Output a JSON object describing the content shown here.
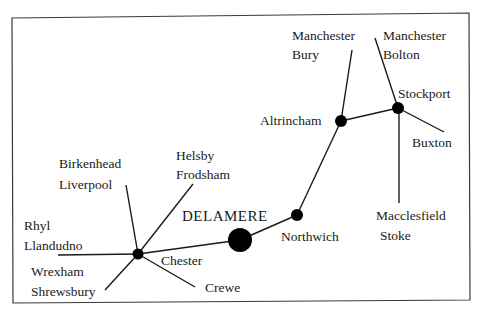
{
  "diagram": {
    "type": "route-map",
    "center": "DELAMERE",
    "nodes": [
      {
        "id": "chester",
        "label": "Chester"
      },
      {
        "id": "delamere",
        "label": "DELAMERE"
      },
      {
        "id": "northwich",
        "label": "Northwich"
      },
      {
        "id": "altrincham",
        "label": "Altrincham"
      },
      {
        "id": "stockport",
        "label": "Stockport"
      }
    ],
    "branches": {
      "rhyl": [
        "Rhyl",
        "Llandudno"
      ],
      "birkenhead": [
        "Birkenhead",
        "Liverpool"
      ],
      "helsby": [
        "Helsby",
        "Frodsham"
      ],
      "wrexham": [
        "Wrexham",
        "Shrewsbury"
      ],
      "crewe": [
        "Crewe"
      ],
      "bury": [
        "Manchester",
        "Bury"
      ],
      "bolton": [
        "Manchester",
        "Bolton"
      ],
      "buxton": [
        "Buxton"
      ],
      "macclesfield": [
        "Macclesfield",
        "Stoke"
      ]
    },
    "colors": {
      "line": "#1a1a1a",
      "node": "#000000",
      "border": "#3a3a3a"
    }
  }
}
